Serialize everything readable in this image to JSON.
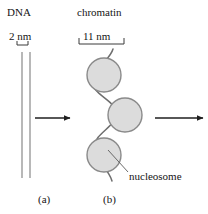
{
  "figure": {
    "width": 208,
    "height": 214,
    "background": "#ffffff"
  },
  "labels": {
    "dna": "DNA",
    "chromatin": "chromatin",
    "nucleosome": "nucleosome",
    "panel_a": "(a)",
    "panel_b": "(b)"
  },
  "scale_bars": {
    "dna": {
      "text": "2 nm",
      "value": 2,
      "unit": "nm"
    },
    "chromatin": {
      "text": "11 nm",
      "value": 11,
      "unit": "nm"
    }
  },
  "colors": {
    "background": "#ffffff",
    "text": "#141414",
    "dna_strand": "#9a9a9a",
    "chromatin_fiber": "#6e6e6e",
    "nucleosome_fill": "#dcdcdc",
    "nucleosome_stroke": "#8a8a8a",
    "arrow": "#1f1f1f",
    "scale_rule": "#3a3a3a",
    "leader_line": "#5a5a5a"
  },
  "panel_a": {
    "name": "dna-duplex",
    "strand_count": 2,
    "strands": [
      {
        "x": 22,
        "y1": 52,
        "y2": 178
      },
      {
        "x": 30,
        "y1": 52,
        "y2": 178
      }
    ]
  },
  "panel_b": {
    "name": "chromatin-fiber",
    "nucleosomes": [
      {
        "index": 1,
        "cx": 104,
        "cy": 75,
        "r": 17
      },
      {
        "index": 2,
        "cx": 125,
        "cy": 115,
        "r": 17
      },
      {
        "index": 3,
        "cx": 104,
        "cy": 155,
        "r": 17
      }
    ],
    "fiber_path": "M 113 49 C 110 60, 96 66, 93 80 C 90 94, 114 99, 116 112 C 118 126, 96 132, 94 146 C 92 160, 108 166, 112 181"
  },
  "arrows": [
    {
      "name": "arrow-dna-to-chromatin",
      "x1": 35,
      "y1": 118,
      "x2": 72,
      "y2": 118
    },
    {
      "name": "arrow-chromatin-onward",
      "x1": 155,
      "y1": 118,
      "x2": 206,
      "y2": 118
    }
  ],
  "leader": {
    "name": "nucleosome-leader-line",
    "x1": 128,
    "y1": 172,
    "x2": 108,
    "y2": 150
  }
}
